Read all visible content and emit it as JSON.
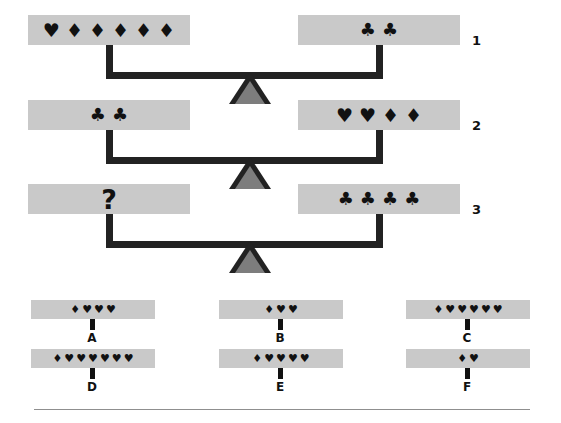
{
  "puzzle": {
    "type": "balance-scale-logic-puzzle",
    "symbols": {
      "heart": "♥",
      "diamond": "♦",
      "club": "♣",
      "question": "?"
    },
    "colors": {
      "pan_fill": "#c9c9c9",
      "beam": "#222222",
      "fulcrum_outline": "#222222",
      "fulcrum_fill": "#7d7d7d",
      "symbol": "#111111",
      "divider": "#8f8f8f",
      "background": "#ffffff"
    },
    "scales": [
      {
        "label": "1",
        "left": {
          "items": [
            "♥",
            "♦",
            "♦",
            "♦",
            "♦",
            "♦"
          ],
          "counts": {
            "heart": 1,
            "diamond": 5,
            "club": 0
          }
        },
        "right": {
          "items": [
            "♣",
            "♣"
          ],
          "counts": {
            "heart": 0,
            "diamond": 0,
            "club": 2
          }
        }
      },
      {
        "label": "2",
        "left": {
          "items": [
            "♣",
            "♣"
          ],
          "counts": {
            "heart": 0,
            "diamond": 0,
            "club": 2
          }
        },
        "right": {
          "items": [
            "♥",
            "♥",
            "♦",
            "♦"
          ],
          "counts": {
            "heart": 2,
            "diamond": 2,
            "club": 0
          }
        }
      },
      {
        "label": "3",
        "left": {
          "items": [
            "?"
          ],
          "counts": {
            "heart": 0,
            "diamond": 0,
            "club": 0
          },
          "is_unknown": true
        },
        "right": {
          "items": [
            "♣",
            "♣",
            "♣",
            "♣"
          ],
          "counts": {
            "heart": 0,
            "diamond": 0,
            "club": 4
          }
        }
      }
    ],
    "options": [
      {
        "label": "A",
        "items": [
          "♦",
          "♥",
          "♥",
          "♥"
        ],
        "counts": {
          "diamond": 1,
          "heart": 3
        }
      },
      {
        "label": "B",
        "items": [
          "♦",
          "♥",
          "♥"
        ],
        "counts": {
          "diamond": 1,
          "heart": 2
        }
      },
      {
        "label": "C",
        "items": [
          "♦",
          "♥",
          "♥",
          "♥",
          "♥",
          "♥"
        ],
        "counts": {
          "diamond": 1,
          "heart": 5
        }
      },
      {
        "label": "D",
        "items": [
          "♦",
          "♥",
          "♥",
          "♥",
          "♥",
          "♥",
          "♥"
        ],
        "counts": {
          "diamond": 1,
          "heart": 6
        }
      },
      {
        "label": "E",
        "items": [
          "♦",
          "♥",
          "♥",
          "♥",
          "♥"
        ],
        "counts": {
          "diamond": 1,
          "heart": 4
        }
      },
      {
        "label": "F",
        "items": [
          "♦",
          "♥"
        ],
        "counts": {
          "diamond": 1,
          "heart": 1
        }
      }
    ]
  }
}
